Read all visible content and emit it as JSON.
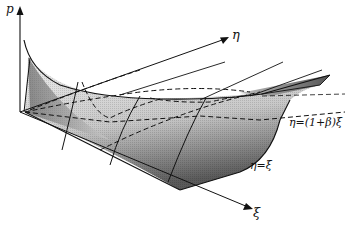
{
  "figure": {
    "axes": {
      "vertical": {
        "label": "p"
      },
      "depth": {
        "label": "η"
      },
      "horizontal": {
        "label": "ξ"
      }
    },
    "curve_labels": {
      "upper_boundary": "η=(1+β)ξ",
      "lower_boundary": "η=ξ"
    },
    "colors": {
      "ink": "#111111",
      "surface_light": "#e6e6e6",
      "surface_dark": "#6a6a6a",
      "background": "#ffffff"
    }
  }
}
